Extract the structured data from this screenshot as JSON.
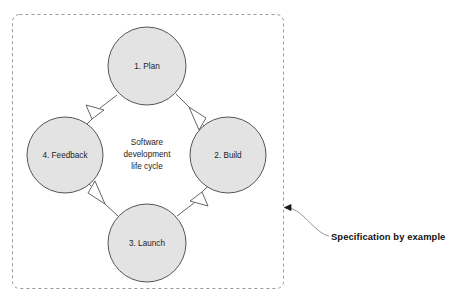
{
  "diagram": {
    "container": {
      "border_style": "dashed",
      "border_color": "#9a9a9a"
    },
    "center_text": {
      "line1": "Software",
      "line2": "development",
      "line3": "life cycle"
    },
    "nodes": [
      {
        "id": "plan",
        "label": "1. Plan",
        "cx": 147,
        "cy": 66,
        "r": 39
      },
      {
        "id": "build",
        "label": "2. Build",
        "cx": 228,
        "cy": 155,
        "r": 38
      },
      {
        "id": "launch",
        "label": "3. Launch",
        "cx": 147,
        "cy": 243,
        "r": 39
      },
      {
        "id": "feedback",
        "label": "4. Feedback",
        "cx": 65,
        "cy": 155,
        "r": 38
      }
    ],
    "flow": [
      {
        "from": "plan",
        "to": "build"
      },
      {
        "from": "build",
        "to": "launch"
      },
      {
        "from": "launch",
        "to": "feedback"
      },
      {
        "from": "feedback",
        "to": "plan"
      }
    ],
    "colors": {
      "node_fill": "#e3e3e3",
      "node_stroke": "#555555",
      "arrow_stroke": "#555555",
      "text": "#1d1d1d"
    }
  },
  "annotation": {
    "label": "Specification by example",
    "color": "#111111"
  }
}
